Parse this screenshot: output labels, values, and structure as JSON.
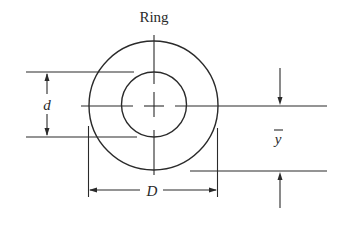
{
  "diagram": {
    "title": "Ring",
    "labels": {
      "inner_diameter": "d",
      "outer_diameter": "D",
      "centroid_distance": "y",
      "centroid_bar": "‾"
    },
    "colors": {
      "stroke": "#2a2a2a",
      "background": "#ffffff"
    },
    "geometry": {
      "center": [
        154,
        106
      ],
      "outer_radius": 64.5,
      "inner_radius": 32.5
    }
  }
}
